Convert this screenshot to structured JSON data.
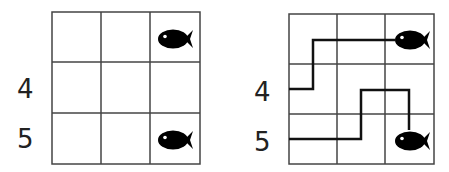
{
  "panels": [
    {
      "id": "before",
      "grid": {
        "rows": 3,
        "cols": 3
      },
      "row_labels": [
        {
          "row": 2,
          "text": "4"
        },
        {
          "row": 3,
          "text": "5"
        }
      ],
      "fish": [
        {
          "row": 1,
          "col": 3
        },
        {
          "row": 3,
          "col": 3
        }
      ],
      "paths": []
    },
    {
      "id": "after",
      "grid": {
        "rows": 3,
        "cols": 3
      },
      "row_labels": [
        {
          "row": 2,
          "text": "4"
        },
        {
          "row": 3,
          "text": "5"
        }
      ],
      "fish": [
        {
          "row": 1,
          "col": 3
        },
        {
          "row": 3,
          "col": 3
        }
      ],
      "paths": [
        {
          "start_label": "4",
          "end": "fish-top-right"
        },
        {
          "start_label": "5",
          "end": "fish-bottom-right"
        }
      ]
    }
  ],
  "colors": {
    "grid_line": "#333333",
    "path": "#111111",
    "fish": "#000000"
  }
}
